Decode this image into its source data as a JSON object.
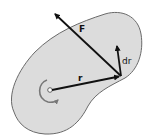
{
  "diagram": {
    "body_fill": "#dcdcdc",
    "body_stroke": "#6a6a6a",
    "vector_color": "#111111",
    "labels": {
      "force": "F",
      "position": "r",
      "displacement": "dr"
    },
    "elements": [
      {
        "name": "rigid-body",
        "type": "blob"
      },
      {
        "name": "axis-of-rotation",
        "type": "circle",
        "x": 50,
        "y": 90
      },
      {
        "name": "rotation-direction",
        "type": "curved-arrow"
      },
      {
        "name": "position-vector-r",
        "from": [
          50,
          90
        ],
        "to": [
          120,
          76
        ]
      },
      {
        "name": "force-vector-F",
        "from": [
          121,
          76
        ],
        "to": [
          54,
          13
        ]
      },
      {
        "name": "displacement-vector-dr",
        "from": [
          121,
          76
        ],
        "to": [
          117,
          45
        ]
      }
    ]
  }
}
